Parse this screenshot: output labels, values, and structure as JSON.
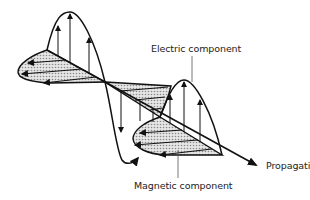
{
  "figure": {
    "labels": {
      "electric": "Electric component",
      "magnetic": "Magnetic component",
      "propagation": "Propagation"
    },
    "colors": {
      "line": "#111111",
      "shading": "#bdbdbd",
      "background": "#ffffff",
      "text": "#222222"
    }
  }
}
